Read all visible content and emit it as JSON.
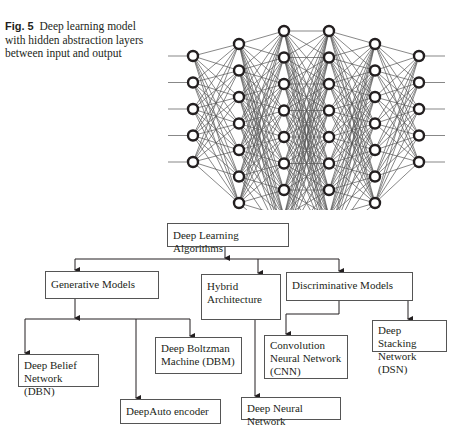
{
  "caption": {
    "label": "Fig. 5",
    "text": "Deep learning model with hidden abstraction layers between input and output"
  },
  "network": {
    "layers": [
      {
        "x": 193,
        "nodes": 5,
        "top": 56
      },
      {
        "x": 239,
        "nodes": 7,
        "top": 44
      },
      {
        "x": 284,
        "nodes": 9,
        "top": 31
      },
      {
        "x": 329,
        "nodes": 9,
        "top": 31
      },
      {
        "x": 375,
        "nodes": 7,
        "top": 44
      },
      {
        "x": 419,
        "nodes": 5,
        "top": 56
      }
    ],
    "spacing": 26.5,
    "input_line_start": 168,
    "output_line_end": 445
  },
  "flowchart": {
    "root": "Deep Learning Algorithms",
    "categories": {
      "generative": "Generative Models",
      "hybrid_line1": "Hybrid",
      "hybrid_line2": "Architecture",
      "discriminative": "Discriminative Models"
    },
    "leaves": {
      "dbn_line1": "Deep Belief",
      "dbn_line2": "Network (DBN)",
      "autoencoder": "DeepAuto encoder",
      "dbm_line1": "Deep Boltzman",
      "dbm_line2": "Machine (DBM)",
      "dnn": "Deep Neural Network",
      "cnn_line1": "Convolution",
      "cnn_line2": "Neural Network",
      "cnn_line3": "(CNN)",
      "dsn_line1": "Deep Stacking",
      "dsn_line2": "Network (DSN)"
    }
  }
}
